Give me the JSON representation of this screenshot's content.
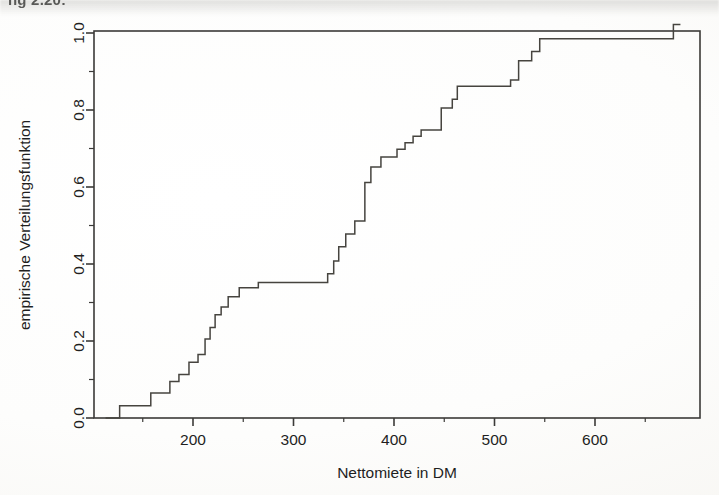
{
  "figure": {
    "caption": "ng 2.20:",
    "background_color": "#ffffff",
    "ink_color": "#3b3a38"
  },
  "chart_data": {
    "type": "line",
    "subtype": "ecdf-step",
    "title": "",
    "xlabel": "Nettomiete in DM",
    "ylabel": "empirische Verteilungsfunktion",
    "xlim": [
      113,
      700
    ],
    "ylim": [
      0.0,
      1.035
    ],
    "grid": false,
    "legend": "none",
    "xticks": [
      200,
      300,
      400,
      500,
      600
    ],
    "xtick_labels": [
      "200",
      "300",
      "400",
      "500",
      "600"
    ],
    "xminor_ticks": [
      150,
      250,
      350,
      450,
      550,
      650
    ],
    "yticks": [
      0.0,
      0.2,
      0.4,
      0.6,
      0.8,
      1.0
    ],
    "ytick_labels": [
      "0.0",
      "0.2",
      "0.4",
      "0.6",
      "0.8",
      "1.0"
    ],
    "yminor_ticks": [
      0.1,
      0.3,
      0.5,
      0.7,
      0.9
    ],
    "series": [
      {
        "name": "empirische Verteilungsfunktion",
        "color": "#46443f",
        "x": [
          113,
          127,
          127,
          158,
          158,
          177,
          177,
          186,
          186,
          196,
          196,
          205,
          205,
          212,
          212,
          217,
          217,
          222,
          222,
          228,
          228,
          235,
          235,
          246,
          246,
          265,
          265,
          334,
          334,
          340,
          340,
          345,
          345,
          352,
          352,
          361,
          361,
          371,
          371,
          377,
          377,
          387,
          387,
          403,
          403,
          411,
          411,
          419,
          419,
          427,
          427,
          447,
          447,
          458,
          458,
          463,
          463,
          516,
          516,
          524,
          524,
          537,
          537,
          545,
          545,
          678,
          678,
          685
        ],
        "y": [
          0.0,
          0.0,
          0.032,
          0.032,
          0.065,
          0.065,
          0.095,
          0.095,
          0.113,
          0.113,
          0.145,
          0.145,
          0.165,
          0.165,
          0.205,
          0.205,
          0.235,
          0.235,
          0.268,
          0.268,
          0.288,
          0.288,
          0.315,
          0.315,
          0.338,
          0.338,
          0.352,
          0.352,
          0.375,
          0.375,
          0.408,
          0.408,
          0.445,
          0.445,
          0.478,
          0.478,
          0.512,
          0.512,
          0.612,
          0.612,
          0.652,
          0.652,
          0.678,
          0.678,
          0.698,
          0.698,
          0.715,
          0.715,
          0.732,
          0.732,
          0.748,
          0.748,
          0.805,
          0.805,
          0.828,
          0.828,
          0.862,
          0.862,
          0.878,
          0.878,
          0.928,
          0.928,
          0.952,
          0.952,
          0.985,
          0.985,
          1.022,
          1.022
        ]
      }
    ],
    "annotations": []
  },
  "geometry": {
    "frame_left_px": 94,
    "frame_right_px": 700,
    "frame_top_px": 31,
    "frame_bottom_px": 418,
    "x_px_at_200": 193,
    "x_px_at_600": 595,
    "y_px_at_0": 418,
    "y_px_at_1": 33
  }
}
